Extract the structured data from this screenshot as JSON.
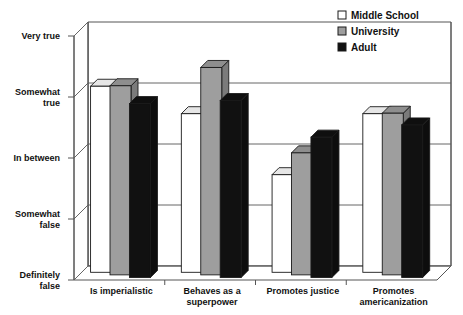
{
  "chart_data": {
    "type": "bar",
    "title": "",
    "subtitle": "",
    "xlabel": "",
    "ylabel": "",
    "style": "3d-clustered-column",
    "grid": true,
    "legend_position": "top-right",
    "categories": [
      "Is imperialistic",
      "Behaves as a superpower",
      "Promotes justice",
      "Promotes americanization"
    ],
    "category_lines": [
      [
        "Is imperialistic"
      ],
      [
        "Behaves as a",
        "superpower"
      ],
      [
        "Promotes justice"
      ],
      [
        "Promotes",
        "americanization"
      ]
    ],
    "y_tick_labels": [
      "Very true",
      "Somewhat true",
      "In between",
      "Somewhat false",
      "Definitely false"
    ],
    "y_tick_lines": [
      [
        "Very true"
      ],
      [
        "Somewhat",
        "true"
      ],
      [
        "In between"
      ],
      [
        "Somewhat",
        "false"
      ],
      [
        "Definitely",
        "false"
      ]
    ],
    "y_tick_values": [
      5,
      4,
      3,
      2,
      1
    ],
    "ylim": [
      1,
      5
    ],
    "series": [
      {
        "name": "Middle School",
        "color": "#ffffff",
        "values": [
          4.05,
          3.6,
          2.6,
          3.6
        ]
      },
      {
        "name": "University",
        "color": "#9e9e9e",
        "values": [
          4.1,
          4.4,
          3.0,
          3.65
        ]
      },
      {
        "name": "Adult",
        "color": "#111111",
        "values": [
          3.85,
          3.9,
          3.3,
          3.5
        ]
      }
    ]
  },
  "legend": {
    "items": [
      {
        "label": "Middle School",
        "color": "#ffffff"
      },
      {
        "label": "University",
        "color": "#9e9e9e"
      },
      {
        "label": "Adult",
        "color": "#111111"
      }
    ]
  },
  "colors": {
    "middle_school": "#ffffff",
    "university": "#9e9e9e",
    "adult": "#111111",
    "axis": "#555555",
    "grid": "#666666",
    "text": "#111111",
    "background": "#ffffff"
  }
}
